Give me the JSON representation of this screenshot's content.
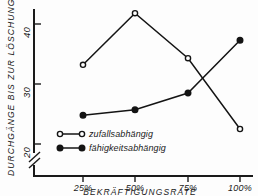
{
  "chart_data": {
    "type": "line",
    "title": "",
    "xlabel": "BEKRÄFTIGUNGSRATE",
    "ylabel": "DURCHGÄNGE BIS ZUR LÖSCHUNG",
    "categories": [
      "25%",
      "50%",
      "75%",
      "100%"
    ],
    "x": [
      25,
      50,
      75,
      100
    ],
    "xtick_labels": [
      "25%",
      "50%",
      "75%",
      "100%"
    ],
    "ytick_labels": [
      "20",
      "30",
      "40"
    ],
    "yticks": [
      20,
      30,
      40
    ],
    "ylim": [
      17,
      44
    ],
    "xlim": [
      12,
      110
    ],
    "grid": false,
    "axis_break": true,
    "legend_position": "inside-lower-left",
    "series": [
      {
        "name": "zufallsabhängig",
        "marker": "open-circle",
        "values": [
          33.2,
          41.8,
          34.3,
          22.5
        ]
      },
      {
        "name": "fähigkeitsabhängig",
        "marker": "filled-circle",
        "values": [
          24.8,
          25.7,
          28.5,
          37.3
        ]
      }
    ],
    "colors": {
      "ink": "#141414",
      "background": "#fdfdfd",
      "marker_fill_open": "#ffffff",
      "marker_fill_filled": "#141414"
    }
  },
  "axes": {
    "y_title": "DURCHGÄNGE BIS ZUR LÖSCHUNG",
    "x_title": "BEKRÄFTIGUNGSRATE",
    "y_tick_40": "40",
    "y_tick_30": "30",
    "y_tick_20": "20",
    "x_tick_1": "25%",
    "x_tick_2": "50%",
    "x_tick_3": "75%",
    "x_tick_4": "100%"
  },
  "legend": {
    "entry_1_label": "zufallsabhängig",
    "entry_1_marker": "open-circle-marker",
    "entry_2_label": "fähigkeitsabhängig",
    "entry_2_marker": "filled-circle-marker"
  }
}
